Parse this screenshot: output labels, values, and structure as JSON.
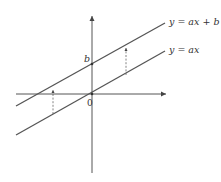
{
  "diagram": {
    "axes": {
      "origin_label": "0",
      "x_axis_arrow": true,
      "y_axis_arrow": true
    },
    "intercept_label": "b",
    "lines": [
      {
        "id": "shifted",
        "label": "y = ax + b"
      },
      {
        "id": "base",
        "label": "y = ax"
      }
    ],
    "translation_arrows": [
      {
        "id": "left",
        "style": "dashed",
        "direction": "up",
        "from": "y = ax",
        "to": "y = ax + b"
      },
      {
        "id": "right",
        "style": "dashed",
        "direction": "up",
        "from": "y = ax",
        "to": "y = ax + b"
      }
    ],
    "colors": {
      "line": "#555555",
      "text": "#333333",
      "background": "#ffffff"
    }
  }
}
